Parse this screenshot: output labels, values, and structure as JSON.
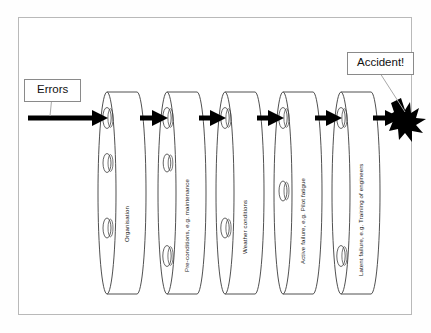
{
  "diagram": {
    "frame": {
      "stroke": "#b9b9b9"
    },
    "input_callout": {
      "label": "Errors",
      "name": "errors-callout"
    },
    "outcome_callout": {
      "label": "Accident!",
      "name": "accident-callout"
    },
    "arrow": {
      "color": "#000000",
      "name": "error-trajectory-arrow"
    },
    "burst": {
      "color": "#000000",
      "name": "accident-burst"
    },
    "slices": [
      {
        "index": 1,
        "label": "Organisation",
        "label_x": 124,
        "label_y": 242,
        "front_cx": 107,
        "front_cy": 193,
        "rx": 9,
        "ry": 101,
        "depth": 30,
        "holes": [
          {
            "cy": 118,
            "rx": 4.2,
            "ry": 10.5
          },
          {
            "cy": 163,
            "rx": 4.0,
            "ry": 9.5
          },
          {
            "cy": 228,
            "rx": 4.0,
            "ry": 10.0
          }
        ]
      },
      {
        "index": 2,
        "label": "Pre-conditions, e.g. maintenance",
        "label_x": 184,
        "label_y": 272,
        "front_cx": 167,
        "front_cy": 193,
        "rx": 9,
        "ry": 101,
        "depth": 30,
        "holes": [
          {
            "cy": 118,
            "rx": 4.2,
            "ry": 10.5
          },
          {
            "cy": 163,
            "rx": 3.8,
            "ry": 9.0
          },
          {
            "cy": 256,
            "rx": 4.2,
            "ry": 10.5
          }
        ]
      },
      {
        "index": 3,
        "label": "Weather conditions",
        "label_x": 242,
        "label_y": 254,
        "front_cx": 225,
        "front_cy": 193,
        "rx": 9,
        "ry": 101,
        "depth": 30,
        "holes": [
          {
            "cy": 118,
            "rx": 4.2,
            "ry": 10.5
          },
          {
            "cy": 228,
            "rx": 4.2,
            "ry": 10.0
          }
        ]
      },
      {
        "index": 4,
        "label": "Active failure, e.g. Pilot fatigue",
        "label_x": 300,
        "label_y": 264,
        "front_cx": 283,
        "front_cy": 193,
        "rx": 9,
        "ry": 101,
        "depth": 30,
        "holes": [
          {
            "cy": 118,
            "rx": 4.2,
            "ry": 10.5
          },
          {
            "cy": 191,
            "rx": 4.0,
            "ry": 10.0
          }
        ]
      },
      {
        "index": 5,
        "label": "Latent failure, e.g. Training of engineers",
        "label_x": 358,
        "label_y": 276,
        "front_cx": 341,
        "front_cy": 193,
        "rx": 9,
        "ry": 101,
        "depth": 30,
        "holes": [
          {
            "cy": 118,
            "rx": 4.2,
            "ry": 10.5
          },
          {
            "cy": 256,
            "rx": 4.2,
            "ry": 10.5
          }
        ]
      }
    ]
  }
}
